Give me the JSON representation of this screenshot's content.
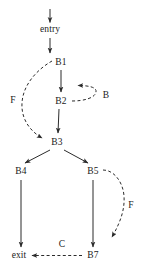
{
  "diagram": {
    "type": "control-flow-graph",
    "title": "",
    "stroke_color": "#2b2b2b",
    "text_color": "#1a1a1a",
    "background_color": "#ffffff",
    "nodes": [
      {
        "id": "entry",
        "label": "entry",
        "x": 50,
        "y": 30
      },
      {
        "id": "B1",
        "label": "B1",
        "x": 61,
        "y": 63
      },
      {
        "id": "B2",
        "label": "B2",
        "x": 61,
        "y": 102
      },
      {
        "id": "B3",
        "label": "B3",
        "x": 57,
        "y": 143
      },
      {
        "id": "B4",
        "label": "B4",
        "x": 21,
        "y": 172
      },
      {
        "id": "B5",
        "label": "B5",
        "x": 93,
        "y": 172
      },
      {
        "id": "B7",
        "label": "B7",
        "x": 93,
        "y": 256
      },
      {
        "id": "exit",
        "label": "exit",
        "x": 19,
        "y": 256
      }
    ],
    "edges": [
      {
        "from": "",
        "to": "entry",
        "style": "solid",
        "label": ""
      },
      {
        "from": "entry",
        "to": "B1",
        "style": "solid",
        "label": ""
      },
      {
        "from": "B1",
        "to": "B2",
        "style": "solid",
        "label": ""
      },
      {
        "from": "B2",
        "to": "B1_edge",
        "style": "dashed",
        "label": "B"
      },
      {
        "from": "B1",
        "to": "B3",
        "style": "dashed",
        "label": "F"
      },
      {
        "from": "B2",
        "to": "B3",
        "style": "solid",
        "label": ""
      },
      {
        "from": "B3",
        "to": "B4",
        "style": "solid",
        "label": ""
      },
      {
        "from": "B3",
        "to": "B5",
        "style": "solid",
        "label": ""
      },
      {
        "from": "B4",
        "to": "exit",
        "style": "solid",
        "label": ""
      },
      {
        "from": "B5",
        "to": "B7",
        "style": "solid",
        "label": ""
      },
      {
        "from": "B5",
        "to": "B7",
        "style": "dashed",
        "label": "F"
      },
      {
        "from": "B7",
        "to": "exit",
        "style": "dashed",
        "label": "C"
      }
    ],
    "edge_labels": [
      {
        "id": "label-B",
        "text": "B",
        "x": 106,
        "y": 96
      },
      {
        "id": "label-F-left",
        "text": "F",
        "x": 13,
        "y": 101
      },
      {
        "id": "label-F-right",
        "text": "F",
        "x": 131,
        "y": 206
      },
      {
        "id": "label-C",
        "text": "C",
        "x": 62,
        "y": 245
      }
    ]
  }
}
